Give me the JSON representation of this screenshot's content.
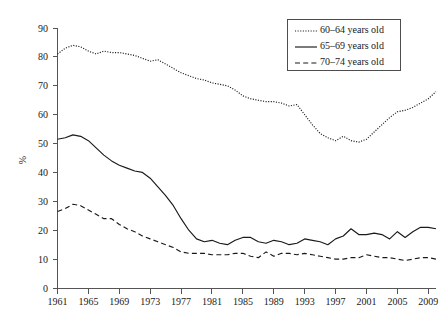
{
  "chart_data": {
    "type": "line",
    "title": "",
    "xlabel": "",
    "ylabel": "%",
    "xlim": [
      1961,
      2010
    ],
    "ylim": [
      0,
      90
    ],
    "grid": false,
    "legend_position": "top-right",
    "x_ticks": [
      "1961",
      "1965",
      "1969",
      "1973",
      "1977",
      "1981",
      "1985",
      "1989",
      "1993",
      "1997",
      "2001",
      "2005",
      "2009"
    ],
    "y_ticks": [
      "0",
      "10",
      "20",
      "30",
      "40",
      "50",
      "60",
      "70",
      "80",
      "90"
    ],
    "x": [
      1961,
      1962,
      1963,
      1964,
      1965,
      1966,
      1967,
      1968,
      1969,
      1970,
      1971,
      1972,
      1973,
      1974,
      1975,
      1976,
      1977,
      1978,
      1979,
      1980,
      1981,
      1982,
      1983,
      1984,
      1985,
      1986,
      1987,
      1988,
      1989,
      1990,
      1991,
      1992,
      1993,
      1994,
      1995,
      1996,
      1997,
      1998,
      1999,
      2000,
      2001,
      2002,
      2003,
      2004,
      2005,
      2006,
      2007,
      2008,
      2009,
      2010
    ],
    "series": [
      {
        "name": "60-64 years old",
        "style": "dotted",
        "values": [
          81.0,
          83.0,
          84.0,
          83.5,
          82.0,
          81.0,
          82.0,
          81.5,
          81.5,
          81.0,
          80.5,
          79.5,
          78.5,
          79.0,
          77.5,
          76.0,
          74.5,
          73.5,
          72.5,
          72.0,
          71.0,
          70.5,
          70.0,
          68.5,
          66.5,
          65.5,
          65.0,
          64.5,
          64.5,
          64.0,
          63.0,
          63.5,
          60.0,
          56.5,
          53.5,
          52.0,
          51.0,
          52.5,
          51.0,
          50.5,
          51.5,
          54.0,
          56.5,
          59.0,
          61.0,
          61.5,
          62.5,
          64.0,
          65.5,
          68.0
        ]
      },
      {
        "name": "65-69 years old",
        "style": "solid",
        "values": [
          51.5,
          52.0,
          53.0,
          52.5,
          51.0,
          48.5,
          46.0,
          44.0,
          42.5,
          41.5,
          40.5,
          40.0,
          38.0,
          35.0,
          32.0,
          28.5,
          24.0,
          20.0,
          17.0,
          16.0,
          16.5,
          15.5,
          15.0,
          16.5,
          17.5,
          17.5,
          16.0,
          15.5,
          16.5,
          16.0,
          15.0,
          15.5,
          17.0,
          16.5,
          16.0,
          15.0,
          17.0,
          18.0,
          20.5,
          18.5,
          18.5,
          19.0,
          18.5,
          17.0,
          19.5,
          17.5,
          19.5,
          21.0,
          21.0,
          20.5
        ]
      },
      {
        "name": "70-74 years old",
        "style": "dashed",
        "values": [
          26.5,
          27.5,
          29.0,
          28.5,
          27.0,
          25.5,
          24.0,
          24.0,
          22.0,
          20.5,
          19.5,
          18.0,
          17.0,
          16.0,
          15.0,
          14.0,
          12.5,
          12.0,
          12.0,
          12.0,
          11.5,
          11.5,
          11.5,
          12.0,
          12.0,
          11.0,
          10.5,
          12.5,
          11.0,
          12.0,
          12.0,
          11.5,
          12.0,
          11.5,
          11.0,
          10.5,
          10.0,
          10.0,
          10.5,
          10.5,
          11.5,
          11.0,
          10.5,
          10.5,
          10.0,
          9.5,
          10.0,
          10.5,
          10.5,
          10.0
        ]
      }
    ]
  },
  "legend": {
    "entries": [
      {
        "label": "60–64 years old",
        "style": "dotted"
      },
      {
        "label": "65–69 years old",
        "style": "solid"
      },
      {
        "label": "70–74 years old",
        "style": "dashed"
      }
    ]
  }
}
